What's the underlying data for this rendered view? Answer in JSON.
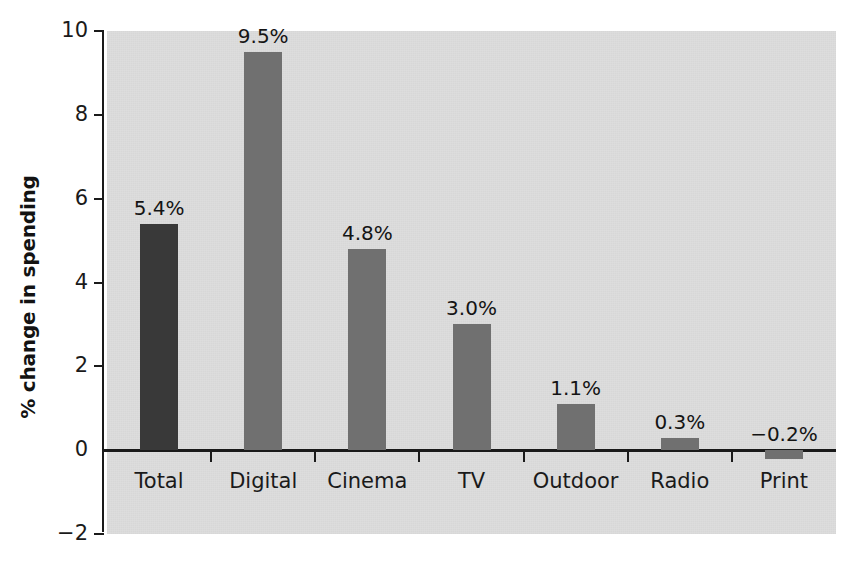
{
  "chart_data": {
    "type": "bar",
    "title": "",
    "xlabel": "",
    "ylabel": "% change in spending",
    "categories": [
      "Total",
      "Digital",
      "Cinema",
      "TV",
      "Outdoor",
      "Radio",
      "Print"
    ],
    "values": [
      5.4,
      9.5,
      4.8,
      3.0,
      1.1,
      0.3,
      -0.2
    ],
    "data_labels": [
      "5.4%",
      "9.5%",
      "4.8%",
      "3.0%",
      "1.1%",
      "0.3%",
      "−0.2%"
    ],
    "ylim": [
      -2,
      10
    ],
    "yticks": [
      -2,
      0,
      2,
      4,
      6,
      8,
      10
    ],
    "ytick_labels": [
      "−2",
      "0",
      "2",
      "4",
      "6",
      "8",
      "10"
    ],
    "grid": false,
    "legend": "none",
    "bar_colors": [
      "#393939",
      "#707070",
      "#707070",
      "#707070",
      "#707070",
      "#707070",
      "#707070"
    ],
    "highlight_color": "#393939",
    "series_color": "#707070",
    "plot_background": "#dddddd",
    "axis_color": "#1a1a1a",
    "page_background": "#ffffff"
  }
}
